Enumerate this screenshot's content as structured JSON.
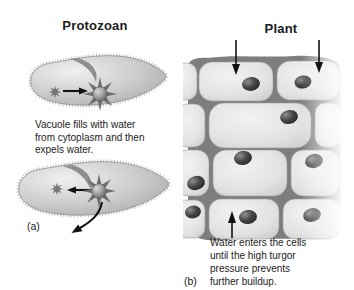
{
  "panel_a": {
    "label": "(a)",
    "title": "Protozoan",
    "caption": "Vacuole fills with water\nfrom cytoplasm and then\nexpels water."
  },
  "panel_b": {
    "label": "(b)",
    "title": "Plant",
    "caption": "Water enters the cells\nuntil the high turgor\npressure prevents\nfurther buildup."
  },
  "icons": {
    "panel_a_top": "water-into-vacuole-arrow",
    "panel_a_bottom": [
      "water-into-vacuole-arrow",
      "water-expelled-arrow"
    ],
    "panel_b": [
      "water-entering-cell-arrow",
      "water-entering-cell-arrow",
      "water-entering-cell-arrow"
    ]
  },
  "colors": {
    "background": "#ffffff",
    "text": "#1c1c1c",
    "arrow": "#111111",
    "cell_wall": "#7e7e7e",
    "cell_fill": "#e3e3e3",
    "nucleus": "#303030",
    "protozoan_body": "#c9c9c9",
    "vacuole": "#6e6e6e"
  }
}
